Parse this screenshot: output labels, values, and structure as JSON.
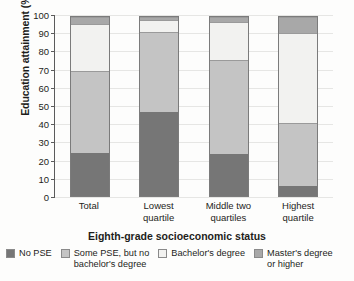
{
  "chart_data": {
    "type": "bar",
    "subtype": "stacked-bar",
    "title": "",
    "xlabel": "Eighth-grade socioeconomic status",
    "ylabel": "Education attainment (%)",
    "ylim": [
      0,
      100
    ],
    "yticks": [
      0,
      10,
      20,
      30,
      40,
      50,
      60,
      70,
      80,
      90,
      100
    ],
    "ytick_labels": [
      "0",
      "10",
      "20",
      "30",
      "40",
      "50",
      "60",
      "70",
      "80",
      "90",
      "100"
    ],
    "grid": true,
    "grid_axis": "y",
    "legend_position": "bottom",
    "stacked_total": 100,
    "categories": [
      "Total",
      "Lowest quartile",
      "Middle two quartiles",
      "Highest quartile"
    ],
    "category_lines": [
      [
        "Total"
      ],
      [
        "Lowest",
        "quartile"
      ],
      [
        "Middle two",
        "quartiles"
      ],
      [
        "Highest",
        "quartile"
      ]
    ],
    "series": [
      {
        "name": "No PSE",
        "color": "#767676",
        "values": [
          24.5,
          48.0,
          24.0,
          5.5
        ]
      },
      {
        "name": "Some PSE, but no bachelor's degree",
        "color": "#c4c4c4",
        "values": [
          46.0,
          44.5,
          52.5,
          35.5
        ]
      },
      {
        "name": "Bachelor's degree",
        "color": "#f2f2f0",
        "values": [
          26.0,
          6.5,
          21.5,
          50.5
        ]
      },
      {
        "name": "Master's degree or higher",
        "color": "#a8a8a8",
        "values": [
          3.5,
          1.0,
          2.0,
          8.5
        ]
      }
    ],
    "cumulative_tops": {
      "Total": [
        24.5,
        70.5,
        96.5,
        100
      ],
      "Lowest quartile": [
        48.0,
        92.5,
        99.0,
        100
      ],
      "Middle two quartiles": [
        24.0,
        76.5,
        98.0,
        100
      ],
      "Highest quartile": [
        5.5,
        41.0,
        91.5,
        100
      ]
    }
  },
  "legend": {
    "items": [
      {
        "label": "No PSE",
        "color": "#767676"
      },
      {
        "label": "Some PSE, but no\nbachelor's degree",
        "color": "#c4c4c4"
      },
      {
        "label": "Bachelor's degree",
        "color": "#f2f2f0"
      },
      {
        "label": "Master's degree\nor higher",
        "color": "#a8a8a8"
      }
    ]
  }
}
